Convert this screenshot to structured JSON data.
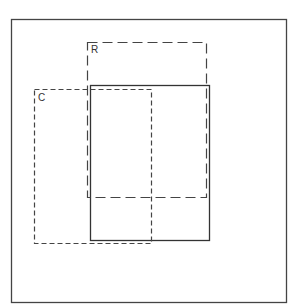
{
  "diagram": {
    "frame": {
      "x": 11,
      "y": 19,
      "w": 275,
      "h": 283
    },
    "rectangles": [
      {
        "id": "R",
        "label": "R",
        "style": "long-dash",
        "x": 87,
        "y": 42,
        "w": 119,
        "h": 155
      },
      {
        "id": "C",
        "label": "C",
        "style": "short-dash",
        "x": 34,
        "y": 89,
        "w": 117,
        "h": 154
      },
      {
        "id": "solid",
        "label": "",
        "style": "solid",
        "x": 90,
        "y": 85,
        "w": 119,
        "h": 155
      }
    ],
    "labels": {
      "r": "R",
      "c": "C"
    },
    "colors": {
      "line": "#333333",
      "frame": "#444444",
      "background": "#ffffff"
    }
  }
}
